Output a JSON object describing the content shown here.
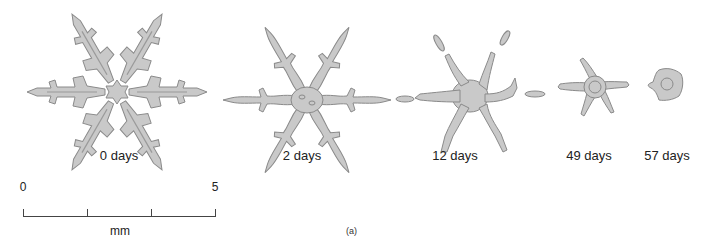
{
  "figure": {
    "panel_label": "(a)",
    "fill_color": "#c9c9c9",
    "outline_color": "#8a8a8a",
    "stages": [
      {
        "label": "0 days"
      },
      {
        "label": "2 days"
      },
      {
        "label": "12 days"
      },
      {
        "label": "49 days"
      },
      {
        "label": "57 days"
      }
    ],
    "scale_bar": {
      "start_label": "0",
      "end_label": "5",
      "unit": "mm"
    }
  }
}
